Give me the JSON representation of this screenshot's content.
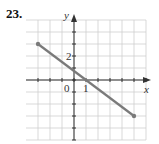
{
  "problem_number": "23.",
  "chart_data": {
    "type": "line",
    "title": "",
    "xlabel": "x",
    "ylabel": "y",
    "tick_labels": {
      "x": [
        "0",
        "1"
      ],
      "y": [
        "2"
      ]
    },
    "grid": true,
    "xlim": [
      -3,
      6
    ],
    "ylim": [
      -5,
      5
    ],
    "series": [
      {
        "name": "segment",
        "x": [
          -3,
          5
        ],
        "y": [
          3,
          -3
        ],
        "endpoints": "closed-dots",
        "color": "#7a7a7a"
      }
    ]
  }
}
